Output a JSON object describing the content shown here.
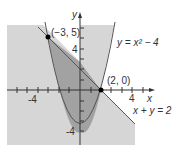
{
  "figure": {
    "type": "inequality-graph",
    "axes": {
      "x_label": "x",
      "y_label": "y",
      "x_tick_labels": [
        "-4",
        "4"
      ],
      "y_tick_labels": [
        "4",
        "-4"
      ]
    },
    "curves": [
      {
        "name": "parabola",
        "label": "y = x² − 4"
      },
      {
        "name": "line",
        "label": "x + y = 2"
      }
    ],
    "points": [
      {
        "label": "(−3, 5)",
        "x": -3,
        "y": 5
      },
      {
        "label": "(2, 0)",
        "x": 2,
        "y": 0
      }
    ],
    "colors": {
      "light_region": "#d4d4d4",
      "dark_region": "#9e9e9e",
      "curve": "#555555",
      "axis": "#333333"
    }
  }
}
